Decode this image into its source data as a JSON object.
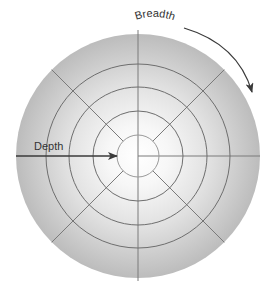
{
  "diagram": {
    "type": "concentric-radial",
    "center": [
      138,
      156
    ],
    "outer_radius": 122,
    "ring_radii": [
      21,
      45,
      69,
      92
    ],
    "spoke_count": 8,
    "colors": {
      "outer_fill": "#bdbdbd",
      "center_fill": "#ffffff",
      "ring_stroke": "#6e6e6e",
      "spoke_stroke": "#7a7a7a",
      "arrow": "#3a3a3a",
      "text": "#333333"
    }
  },
  "labels": {
    "depth": "Depth",
    "breadth": "Breadth"
  },
  "arrows": {
    "depth": {
      "from": [
        16,
        156
      ],
      "to": [
        117,
        156
      ],
      "direction": "inward toward center"
    },
    "breadth": {
      "direction": "clockwise along outer edge"
    }
  }
}
